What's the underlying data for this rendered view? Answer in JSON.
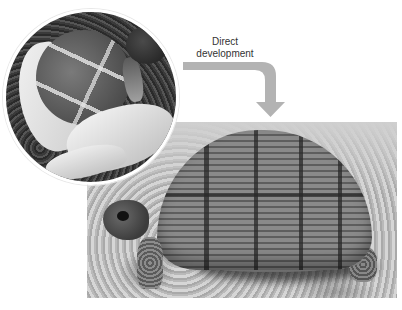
{
  "caption": {
    "line1": "Direct",
    "line2": "development"
  },
  "images": {
    "hatchling": {
      "alt": "Tortoise hatchling emerging from egg",
      "shape": "circle"
    },
    "adult": {
      "alt": "Adult tortoise walking on gravel"
    }
  },
  "arrow": {
    "icon": "curved-arrow-down-icon",
    "color": "#b3b3b3"
  },
  "colors": {
    "background": "#ffffff",
    "text": "#333333",
    "arrow": "#b3b3b3"
  }
}
